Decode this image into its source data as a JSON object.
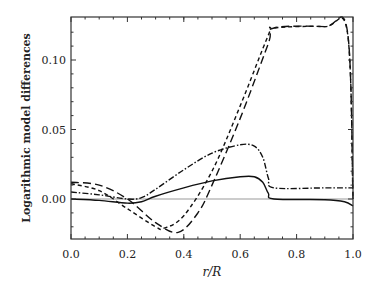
{
  "chart_data": {
    "type": "line",
    "title": "",
    "xlabel": "r/R",
    "ylabel": "Logarithmic model differences",
    "xlim": [
      0.0,
      1.0
    ],
    "ylim": [
      -0.03,
      0.13
    ],
    "xticks": [
      0.0,
      0.2,
      0.4,
      0.6,
      0.8,
      1.0
    ],
    "xtick_labels": [
      "0.0",
      "0.2",
      "0.4",
      "0.6",
      "0.8",
      "1.0"
    ],
    "yticks": [
      0.0,
      0.05,
      0.1
    ],
    "ytick_labels": [
      "0.00",
      "0.05",
      "0.10"
    ],
    "grid": false,
    "legend": null,
    "reference_line": {
      "y": 0.0,
      "color": "#999999"
    },
    "series": [
      {
        "name": "solid",
        "style": "solid",
        "x": [
          0.0,
          0.1,
          0.2,
          0.25,
          0.3,
          0.4,
          0.5,
          0.6,
          0.65,
          0.68,
          0.7,
          0.72,
          0.9,
          0.97,
          1.0
        ],
        "y": [
          0.0,
          -0.001,
          -0.003,
          -0.002,
          0.002,
          0.008,
          0.013,
          0.016,
          0.016,
          0.012,
          0.004,
          0.0,
          -0.0005,
          -0.002,
          -0.005
        ]
      },
      {
        "name": "dash-dot",
        "style": "dashdot",
        "x": [
          0.0,
          0.1,
          0.2,
          0.25,
          0.3,
          0.4,
          0.5,
          0.6,
          0.65,
          0.68,
          0.7,
          0.72,
          0.9,
          1.0
        ],
        "y": [
          0.005,
          0.003,
          0.0,
          0.001,
          0.007,
          0.021,
          0.033,
          0.039,
          0.038,
          0.03,
          0.015,
          0.008,
          0.008,
          0.008
        ]
      },
      {
        "name": "short-dashed",
        "style": "dashed",
        "x": [
          0.0,
          0.1,
          0.2,
          0.3,
          0.33,
          0.4,
          0.5,
          0.6,
          0.7,
          0.72,
          0.9,
          0.98,
          1.0
        ],
        "y": [
          0.011,
          0.006,
          -0.007,
          -0.02,
          -0.021,
          -0.012,
          0.02,
          0.067,
          0.118,
          0.123,
          0.124,
          0.12,
          0.0
        ]
      },
      {
        "name": "long-dashed",
        "style": "longdash",
        "x": [
          0.0,
          0.1,
          0.2,
          0.3,
          0.38,
          0.45,
          0.5,
          0.6,
          0.7,
          0.72,
          0.9,
          0.98,
          1.0
        ],
        "y": [
          0.012,
          0.01,
          0.0,
          -0.017,
          -0.024,
          -0.01,
          0.01,
          0.058,
          0.112,
          0.123,
          0.124,
          0.121,
          0.0
        ]
      }
    ]
  }
}
